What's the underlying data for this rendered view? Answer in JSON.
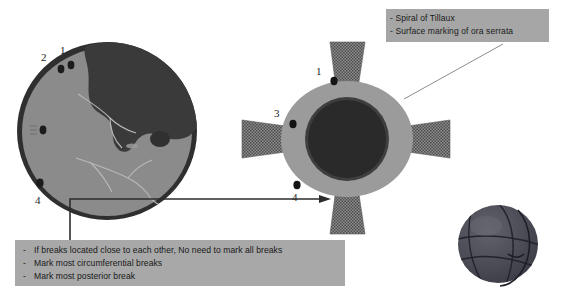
{
  "page": {
    "background_color": "#ffffff",
    "width": 561,
    "height": 303
  },
  "fundus_diagram": {
    "name": "retinal-fundus-drawing",
    "description": "Fundus drawing of retina with detachment",
    "colors": {
      "attached_retina": "#8a8a8a",
      "detached_retina": "#3a3a3a",
      "rim": "#2e2e2e",
      "vessel": "#b5b5b5",
      "break_mark": "#1e1e1e"
    },
    "break_labels": [
      {
        "id": "break-1",
        "text": "1"
      },
      {
        "id": "break-2",
        "text": "2"
      },
      {
        "id": "break-4",
        "text": "4"
      }
    ]
  },
  "anterior_eye_diagram": {
    "name": "anterior-segment-eye-drawing",
    "description": "Anterior view of globe with four rectus muscles",
    "colors": {
      "sclera": "#9a9a9a",
      "cornea": "#2b2b2b",
      "limbus": "#3f3f3f",
      "muscle": "#707070",
      "break_mark": "#151515"
    },
    "break_labels": [
      {
        "id": "break-1",
        "text": "1"
      },
      {
        "id": "break-3",
        "text": "3"
      },
      {
        "id": "break-4",
        "text": "4"
      }
    ],
    "muscles": [
      {
        "name": "superior-rectus"
      },
      {
        "name": "medial-rectus"
      },
      {
        "name": "inferior-rectus"
      },
      {
        "name": "lateral-rectus"
      }
    ]
  },
  "ora_callout": {
    "name": "landmark-callout",
    "background_color": "#a6a6a6",
    "lines": [
      "- Spiral of Tillaux",
      "- Surface marking of ora serrata"
    ]
  },
  "breaks_note": {
    "name": "break-marking-guidance",
    "background_color": "#a8a8a8",
    "bullet": "-",
    "lines": [
      "If breaks located close to each other, No need to mark all breaks",
      "Mark most circumferential breaks",
      "Mark most posterior break"
    ]
  },
  "globe_illustration": {
    "name": "three-d-globe-illustration",
    "colors": {
      "body": "#4a4a52",
      "line": "#20202a"
    }
  }
}
